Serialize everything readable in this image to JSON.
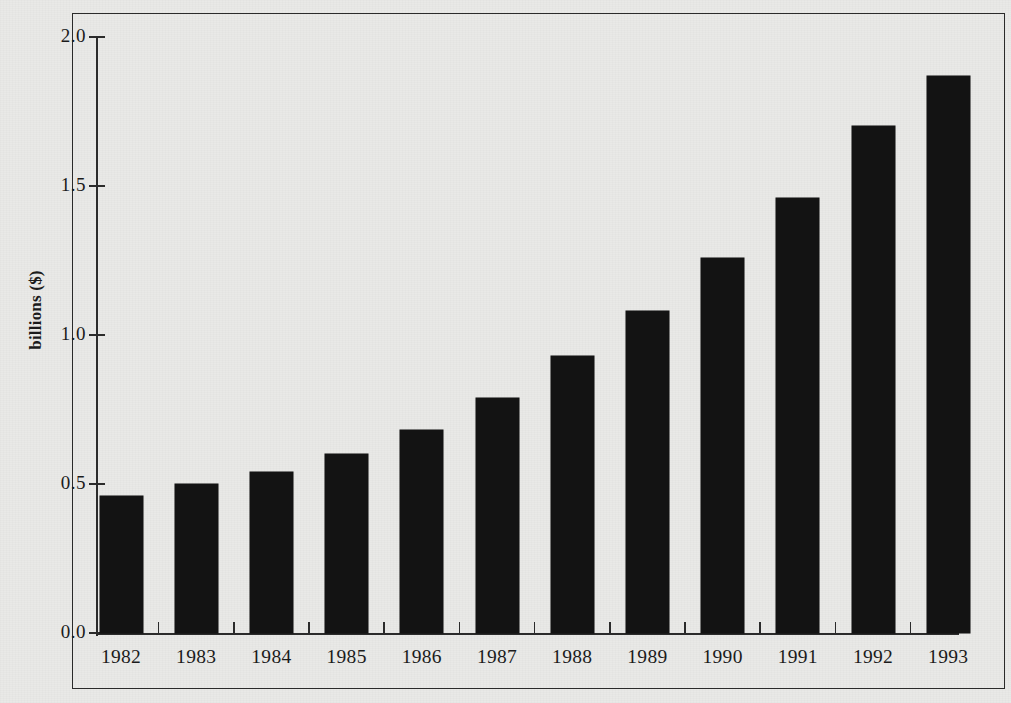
{
  "chart_data": {
    "type": "bar",
    "title": "",
    "subtitle": "",
    "xlabel": "",
    "ylabel": "billions ($)",
    "categories": [
      "1982",
      "1983",
      "1984",
      "1985",
      "1986",
      "1987",
      "1988",
      "1989",
      "1990",
      "1991",
      "1992",
      "1993"
    ],
    "values": [
      0.46,
      0.5,
      0.54,
      0.6,
      0.68,
      0.79,
      0.93,
      1.08,
      1.26,
      1.46,
      1.7,
      1.87
    ],
    "series": [
      {
        "name": "billions ($)",
        "values": [
          0.46,
          0.5,
          0.54,
          0.6,
          0.68,
          0.79,
          0.93,
          1.08,
          1.26,
          1.46,
          1.7,
          1.87
        ]
      }
    ],
    "ylim": [
      0.0,
      2.0
    ],
    "ytick_labels": [
      "0.0",
      "0.5",
      "1.0",
      "1.5",
      "2.0"
    ],
    "ytick_values": [
      0.0,
      0.5,
      1.0,
      1.5,
      2.0
    ],
    "grid": false,
    "legend": false,
    "legend_position": "none",
    "bar_color": "#131313",
    "background_color": "#e9e9e7",
    "axis_color": "#2b2b2b"
  },
  "axis": {
    "y_title": "billions ($)",
    "y_ticks": [
      {
        "label": "2.0",
        "value": 2.0
      },
      {
        "label": "1.5",
        "value": 1.5
      },
      {
        "label": "1.0",
        "value": 1.0
      },
      {
        "label": "0.5",
        "value": 0.5
      },
      {
        "label": "0.0",
        "value": 0.0
      }
    ],
    "x_ticks": [
      "1982",
      "1983",
      "1984",
      "1985",
      "1986",
      "1987",
      "1988",
      "1989",
      "1990",
      "1991",
      "1992",
      "1993"
    ]
  }
}
